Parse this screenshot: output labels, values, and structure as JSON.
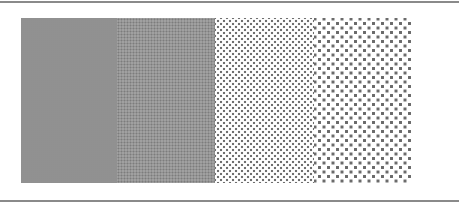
{
  "figure": {
    "rules": {
      "color": "#8a8a8a"
    },
    "panels": [
      {
        "id": "p1",
        "pattern": "very-fine-halftone",
        "dot_color": "#8f8f8f"
      },
      {
        "id": "p2",
        "pattern": "fine-halftone",
        "dot_color": "#7c7c7c"
      },
      {
        "id": "p3",
        "pattern": "medium-halftone",
        "dot_color": "#6f6f6f"
      },
      {
        "id": "p4",
        "pattern": "coarse-halftone",
        "dot_color": "#6a6a6a"
      }
    ]
  }
}
